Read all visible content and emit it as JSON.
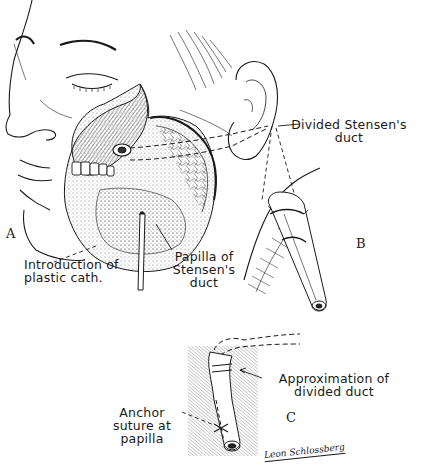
{
  "figure": {
    "panels": {
      "a": "A",
      "b": "B",
      "c": "C"
    },
    "labels": {
      "divided_duct_line1": "Divided Stensen's",
      "divided_duct_line2": "duct",
      "intro_cath_line1": "Introduction of",
      "intro_cath_line2": "plastic cath.",
      "papilla_line1": "Papilla of",
      "papilla_line2": "Stensen's",
      "papilla_line3": "duct",
      "approx_line1": "Approximation of",
      "approx_line2": "divided duct",
      "anchor_line1": "Anchor",
      "anchor_line2": "suture at",
      "anchor_line3": "papilla"
    },
    "signature": "Leon Schlossberg",
    "colors": {
      "ink": "#1a1a1a",
      "background": "#ffffff"
    }
  }
}
